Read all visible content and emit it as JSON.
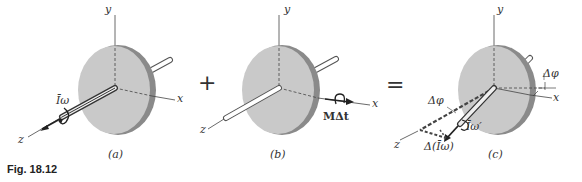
{
  "figure": {
    "caption": "Fig. 18.12",
    "operators": {
      "plus": "+",
      "equals": "="
    },
    "panels": [
      {
        "id": "a",
        "label": "(a)",
        "axes": {
          "x": "x",
          "y": "y",
          "z": "z"
        },
        "vector_label": "Īω"
      },
      {
        "id": "b",
        "label": "(b)",
        "axes": {
          "x": "x",
          "y": "y",
          "z": "z"
        },
        "vector_label": "MΔt"
      },
      {
        "id": "c",
        "label": "(c)",
        "axes": {
          "x": "x",
          "y": "y",
          "z": "z"
        },
        "vector_label": "Īω′",
        "delta_label": "Δ(Īω)",
        "angle_label_left": "Δφ",
        "angle_label_right": "Δφ"
      }
    ]
  },
  "colors": {
    "disk_face": "#c9c9c9",
    "disk_rim": "#8a8a8a",
    "line": "#444444",
    "shaft": "#ffffff"
  }
}
